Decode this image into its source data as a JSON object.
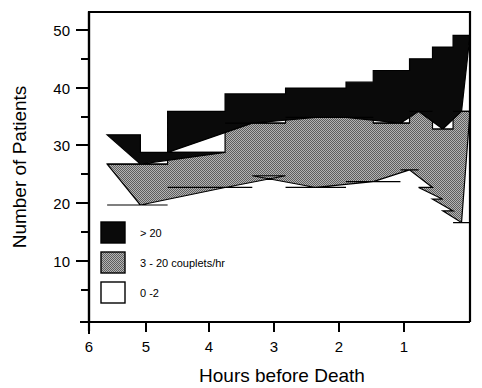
{
  "chart_data": {
    "type": "area",
    "title": "",
    "xlabel": "Hours before Death",
    "ylabel": "Number of Patients",
    "xlim": [
      6.3,
      0.0
    ],
    "ylim": [
      0,
      53
    ],
    "x_ticks": [
      "6",
      "5",
      "4",
      "3",
      "2",
      "1"
    ],
    "x_tick_values": [
      6,
      5,
      4,
      3,
      2,
      1
    ],
    "y_ticks": [
      "10",
      "20",
      "30",
      "40",
      "50"
    ],
    "y_tick_values": [
      10,
      20,
      30,
      40,
      50
    ],
    "y_minor_tick_values": [
      5,
      15,
      25,
      35,
      45
    ],
    "grid": false,
    "stacked": true,
    "legend_position": "inside-lower-left",
    "series": [
      {
        "name": "0 -2",
        "color": "#ffffff",
        "edge": "#000000",
        "values": [
          20,
          20,
          23,
          23,
          25,
          25,
          23,
          23,
          24,
          24,
          24,
          26,
          23,
          21,
          20,
          19,
          17
        ]
      },
      {
        "name": "3 - 20 couplets/hr",
        "color": "#9a9a9a",
        "edge": "#000000",
        "values": [
          7,
          7,
          6,
          6,
          9,
          9,
          12,
          12,
          11,
          11,
          11,
          10,
          13,
          15,
          16,
          17,
          19
        ]
      },
      {
        "name": "> 20",
        "color": "#000000",
        "edge": "#000000",
        "values": [
          5,
          2,
          7,
          5,
          5,
          6,
          6,
          6,
          7,
          9,
          9,
          9,
          10,
          12,
          13,
          13,
          13
        ]
      }
    ],
    "steps": [
      {
        "x_start": 6.0,
        "x_end": 5.45,
        "low": 20,
        "mid": 27,
        "top": 32
      },
      {
        "x_start": 5.45,
        "x_end": 5.0,
        "low": 20,
        "mid": 27,
        "top": 29
      },
      {
        "x_start": 5.0,
        "x_end": 4.05,
        "low": 23,
        "mid": 29,
        "top": 36
      },
      {
        "x_start": 4.05,
        "x_end": 3.6,
        "low": 23,
        "mid": 34,
        "top": 39
      },
      {
        "x_start": 3.6,
        "x_end": 3.05,
        "low": 25,
        "mid": 34,
        "top": 39
      },
      {
        "x_start": 3.05,
        "x_end": 2.55,
        "low": 23,
        "mid": 35,
        "top": 40
      },
      {
        "x_start": 2.55,
        "x_end": 2.05,
        "low": 23,
        "mid": 35,
        "top": 40
      },
      {
        "x_start": 2.05,
        "x_end": 1.6,
        "low": 24,
        "mid": 35,
        "top": 41
      },
      {
        "x_start": 1.6,
        "x_end": 1.15,
        "low": 24,
        "mid": 34,
        "top": 43
      },
      {
        "x_start": 1.15,
        "x_end": 1.0,
        "low": 26,
        "mid": 34,
        "top": 43
      },
      {
        "x_start": 1.0,
        "x_end": 0.85,
        "low": 26,
        "mid": 36,
        "top": 45
      },
      {
        "x_start": 0.85,
        "x_end": 0.62,
        "low": 23,
        "mid": 36,
        "top": 45
      },
      {
        "x_start": 0.62,
        "x_end": 0.45,
        "low": 21,
        "mid": 33,
        "top": 47
      },
      {
        "x_start": 0.45,
        "x_end": 0.28,
        "low": 19,
        "mid": 33,
        "top": 47
      },
      {
        "x_start": 0.28,
        "x_end": 0.14,
        "low": 17,
        "mid": 36,
        "top": 49
      },
      {
        "x_start": 0.14,
        "x_end": 0.0,
        "low": 17,
        "mid": 36,
        "top": 49
      }
    ]
  },
  "legend": {
    "items": [
      {
        "label": "> 20",
        "swatch": "black"
      },
      {
        "label": "3 - 20 couplets/hr",
        "swatch": "gray"
      },
      {
        "label": "0 -2",
        "swatch": "white"
      }
    ]
  },
  "axes": {
    "y_title": "Number of Patients",
    "x_title": "Hours before Death",
    "y_tick_labels": [
      "50",
      "40",
      "30",
      "20",
      "10"
    ],
    "x_tick_labels": [
      "6",
      "5",
      "4",
      "3",
      "2",
      "1"
    ]
  },
  "colors": {
    "black": "#000000",
    "gray": "#9a9a9a",
    "white": "#ffffff",
    "axis": "#000000",
    "background": "#ffffff"
  }
}
